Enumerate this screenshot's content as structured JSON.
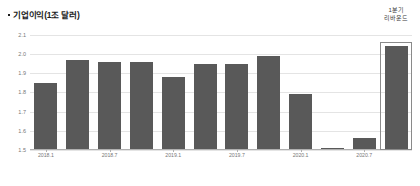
{
  "chart_data": {
    "type": "bar",
    "title": "기업이익(1조 달러)",
    "xlabel": "",
    "ylabel": "",
    "ylim": [
      1.5,
      2.12
    ],
    "grid": true,
    "legend": null,
    "yticks": [
      "2.1",
      "2.0",
      "1.9",
      "1.8",
      "1.7",
      "1.6",
      "1.5"
    ],
    "ytick_values": [
      2.1,
      2.0,
      1.9,
      1.8,
      1.7,
      1.6,
      1.5
    ],
    "xticks": [
      "2018.1",
      "2018.7",
      "2019.1",
      "2019.7",
      "2020.1",
      "2020.7"
    ],
    "xtick_indices": [
      0,
      2,
      4,
      6,
      8,
      10
    ],
    "categories": [
      "2018.1",
      "2018.4",
      "2018.7",
      "2018.10",
      "2019.1",
      "2019.4",
      "2019.7",
      "2019.10",
      "2020.1",
      "2020.4",
      "2020.7",
      "2020.10"
    ],
    "values": [
      1.85,
      1.97,
      1.96,
      1.96,
      1.88,
      1.95,
      1.95,
      1.99,
      1.79,
      1.51,
      1.56,
      2.04
    ],
    "bar_color": "#595959",
    "highlight_index": 11,
    "annotations": [
      {
        "line1": "1분기",
        "line2": "리바운드",
        "target_index": 11
      }
    ]
  },
  "title_bullet": "•"
}
